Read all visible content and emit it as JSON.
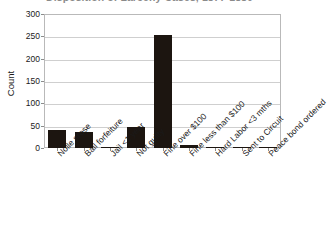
{
  "chart_data": {
    "type": "bar",
    "title": "Disposition of Larceny Cases, 1877-1880",
    "xlabel": "",
    "ylabel": "Count",
    "ylim": [
      0,
      300
    ],
    "ytick_step": 50,
    "yticks": [
      300,
      250,
      200,
      150,
      100,
      50,
      0
    ],
    "grid": true,
    "legend": "none",
    "bar_color": "#1c1510",
    "categories": [
      "Nolle prose",
      "Bail forfeiture",
      "Jail <1 year",
      "Not guilty",
      "Fine over $100",
      "Fine less than $100",
      "Hard Labor <3 mths",
      "Sent to Circuit",
      "Peace bond ordered"
    ],
    "values": [
      41,
      36,
      3,
      48,
      253,
      7,
      2,
      1,
      1
    ]
  },
  "axes": {
    "y_title": "Count",
    "y_tick_labels": [
      "300",
      "250",
      "200",
      "150",
      "100",
      "50",
      "0"
    ]
  },
  "title": {
    "text": "Disposition of Larceny Cases, 1877-1880"
  }
}
